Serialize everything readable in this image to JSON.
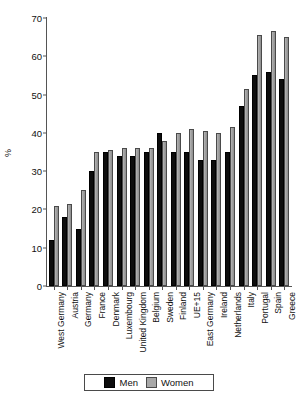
{
  "chart_data": {
    "type": "bar",
    "title": "",
    "xlabel": "",
    "ylabel": "%",
    "ylim": [
      0,
      70
    ],
    "yticks": [
      0,
      10,
      20,
      30,
      40,
      50,
      60,
      70
    ],
    "grid": false,
    "legend_position": "bottom",
    "categories": [
      "West Germany",
      "Austria",
      "Germany",
      "France",
      "Denmark",
      "Luxembourg",
      "United Kingdom",
      "Belgium",
      "Sweden",
      "Finland",
      "UE+15",
      "East Germany",
      "Ireland",
      "Netherlands",
      "Italy",
      "Portugal",
      "Spain",
      "Greece"
    ],
    "series": [
      {
        "name": "Men",
        "color": "#0d0d0d",
        "values": [
          12,
          18,
          15,
          30,
          35,
          34,
          34,
          35,
          40,
          35,
          35,
          33,
          33,
          35,
          47,
          55,
          56,
          54
        ]
      },
      {
        "name": "Women",
        "color": "#a8a8a8",
        "values": [
          21,
          21.5,
          25,
          35,
          35.5,
          36,
          36,
          36,
          38,
          40,
          41,
          40.5,
          40,
          41.5,
          51.5,
          65.5,
          66.5,
          65
        ]
      }
    ]
  },
  "legend": {
    "items": [
      {
        "label": "Men",
        "swatch": "men-swatch"
      },
      {
        "label": "Women",
        "swatch": "women-swatch"
      }
    ]
  },
  "axis": {
    "y_title": "%"
  }
}
